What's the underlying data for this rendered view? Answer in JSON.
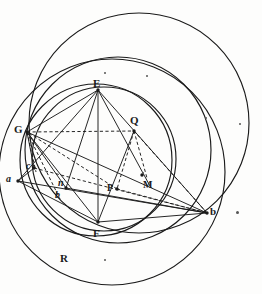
{
  "figure": {
    "kind": "geometric-construction-diagram",
    "background": "#fdfdfc",
    "ink": "#1a1a1a",
    "width": 262,
    "height": 294
  },
  "labels": [
    {
      "id": "E",
      "text": "E",
      "x": 93,
      "y": 78,
      "size": 11,
      "style": "roman"
    },
    {
      "id": "G",
      "text": "G",
      "x": 14,
      "y": 124,
      "size": 11,
      "style": "roman"
    },
    {
      "id": "Q",
      "text": "Q",
      "x": 130,
      "y": 115,
      "size": 11,
      "style": "roman"
    },
    {
      "id": "M",
      "text": "M",
      "x": 143,
      "y": 180,
      "size": 10,
      "style": "roman"
    },
    {
      "id": "P",
      "text": "P",
      "x": 107,
      "y": 183,
      "size": 10,
      "style": "roman"
    },
    {
      "id": "F",
      "text": "F",
      "x": 93,
      "y": 228,
      "size": 11,
      "style": "roman"
    },
    {
      "id": "R",
      "text": "R",
      "x": 60,
      "y": 253,
      "size": 11,
      "style": "roman"
    },
    {
      "id": "a",
      "text": "a",
      "x": 6,
      "y": 174,
      "size": 10,
      "style": "italic"
    },
    {
      "id": "c",
      "text": "c",
      "x": 26,
      "y": 161,
      "size": 10,
      "style": "italic"
    },
    {
      "id": "n",
      "text": "n",
      "x": 58,
      "y": 178,
      "size": 10,
      "style": "italic"
    },
    {
      "id": "b",
      "text": "b",
      "x": 55,
      "y": 190,
      "size": 10,
      "style": "italic"
    },
    {
      "id": "D",
      "text": "b",
      "x": 210,
      "y": 206,
      "size": 11,
      "style": "roman"
    }
  ],
  "circles": [
    {
      "id": "outer-large",
      "cx": 139,
      "cy": 123,
      "r": 110,
      "dash": "none"
    },
    {
      "id": "lower-large",
      "cx": 112,
      "cy": 172,
      "r": 113,
      "dash": "none"
    },
    {
      "id": "main-through-EGF",
      "cx": 96,
      "cy": 160,
      "r": 76,
      "dash": "none"
    },
    {
      "id": "second-through-EF",
      "cx": 104,
      "cy": 159,
      "r": 72,
      "dash": "none"
    },
    {
      "id": "right-through-Db",
      "cx": 118,
      "cy": 150,
      "r": 93,
      "dash": "none"
    }
  ],
  "points": [
    {
      "id": "E-pt",
      "x": 98,
      "y": 90
    },
    {
      "id": "G-pt",
      "x": 27,
      "y": 132
    },
    {
      "id": "Q-pt",
      "x": 134,
      "y": 131
    },
    {
      "id": "P-pt",
      "x": 117,
      "y": 189
    },
    {
      "id": "M-pt",
      "x": 142,
      "y": 175
    },
    {
      "id": "F-pt",
      "x": 98,
      "y": 222
    },
    {
      "id": "a-pt",
      "x": 18,
      "y": 181
    },
    {
      "id": "c-pt",
      "x": 34,
      "y": 168
    },
    {
      "id": "n-pt",
      "x": 66,
      "y": 188
    },
    {
      "id": "D-pt",
      "x": 207,
      "y": 213
    }
  ],
  "solid_segments": [
    {
      "id": "E-F",
      "x1": 98,
      "y1": 90,
      "x2": 98,
      "y2": 222
    },
    {
      "id": "E-G",
      "x1": 98,
      "y1": 90,
      "x2": 27,
      "y2": 132
    },
    {
      "id": "E-a",
      "x1": 98,
      "y1": 90,
      "x2": 18,
      "y2": 181
    },
    {
      "id": "E-n",
      "x1": 98,
      "y1": 90,
      "x2": 66,
      "y2": 188
    },
    {
      "id": "E-D",
      "x1": 98,
      "y1": 90,
      "x2": 207,
      "y2": 213
    },
    {
      "id": "E-M",
      "x1": 98,
      "y1": 90,
      "x2": 150,
      "y2": 186
    },
    {
      "id": "G-F",
      "x1": 27,
      "y1": 132,
      "x2": 98,
      "y2": 222
    },
    {
      "id": "G-n",
      "x1": 27,
      "y1": 132,
      "x2": 66,
      "y2": 188
    },
    {
      "id": "G-D",
      "x1": 27,
      "y1": 132,
      "x2": 207,
      "y2": 213
    },
    {
      "id": "a-D",
      "x1": 18,
      "y1": 181,
      "x2": 207,
      "y2": 213
    },
    {
      "id": "a-c",
      "x1": 18,
      "y1": 181,
      "x2": 34,
      "y2": 168
    },
    {
      "id": "c-G",
      "x1": 34,
      "y1": 168,
      "x2": 27,
      "y2": 132
    },
    {
      "id": "F-D",
      "x1": 98,
      "y1": 222,
      "x2": 207,
      "y2": 213
    },
    {
      "id": "n-D",
      "x1": 66,
      "y1": 188,
      "x2": 207,
      "y2": 213
    },
    {
      "id": "a-F",
      "x1": 18,
      "y1": 181,
      "x2": 98,
      "y2": 222
    },
    {
      "id": "Q-F",
      "x1": 134,
      "y1": 131,
      "x2": 98,
      "y2": 222
    }
  ],
  "dashed_segments": [
    {
      "id": "G-Q",
      "x1": 27,
      "y1": 132,
      "x2": 134,
      "y2": 131
    },
    {
      "id": "Q-P",
      "x1": 134,
      "y1": 131,
      "x2": 117,
      "y2": 189
    },
    {
      "id": "P-G",
      "x1": 117,
      "y1": 189,
      "x2": 27,
      "y2": 132
    },
    {
      "id": "P-D",
      "x1": 117,
      "y1": 189,
      "x2": 207,
      "y2": 213
    },
    {
      "id": "Q-D",
      "x1": 134,
      "y1": 131,
      "x2": 207,
      "y2": 213
    },
    {
      "id": "G-b",
      "x1": 27,
      "y1": 132,
      "x2": 60,
      "y2": 199
    },
    {
      "id": "G-c2",
      "x1": 27,
      "y1": 132,
      "x2": 36,
      "y2": 172
    },
    {
      "id": "c-D",
      "x1": 34,
      "y1": 168,
      "x2": 207,
      "y2": 213
    },
    {
      "id": "Q-M",
      "x1": 134,
      "y1": 131,
      "x2": 147,
      "y2": 178
    }
  ],
  "specks": [
    {
      "id": "speck-1",
      "x": 104,
      "y": 72,
      "d": 2
    },
    {
      "id": "speck-2",
      "x": 146,
      "y": 75,
      "d": 2
    },
    {
      "id": "speck-3",
      "x": 205,
      "y": 117,
      "d": 2
    },
    {
      "id": "speck-4",
      "x": 239,
      "y": 123,
      "d": 2
    },
    {
      "id": "speck-5",
      "x": 142,
      "y": 172,
      "d": 2
    },
    {
      "id": "speck-6",
      "x": 236,
      "y": 211,
      "d": 3
    },
    {
      "id": "speck-7",
      "x": 104,
      "y": 259,
      "d": 2
    }
  ]
}
